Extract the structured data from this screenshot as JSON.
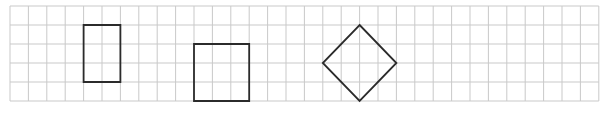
{
  "grid": {
    "columns": 32,
    "rows": 5,
    "line_color": "#c9c9c9",
    "shape_color": "#2b2b2b"
  },
  "shapes": [
    {
      "name": "rectangle",
      "kind": "polygon",
      "points_grid": [
        [
          4,
          1
        ],
        [
          6,
          1
        ],
        [
          6,
          4
        ],
        [
          4,
          4
        ]
      ],
      "width_cells": 2,
      "height_cells": 3
    },
    {
      "name": "square",
      "kind": "polygon",
      "points_grid": [
        [
          10,
          2
        ],
        [
          13,
          2
        ],
        [
          13,
          5
        ],
        [
          10,
          5
        ]
      ],
      "width_cells": 3,
      "height_cells": 3
    },
    {
      "name": "diamond",
      "kind": "polygon",
      "points_grid": [
        [
          19,
          1
        ],
        [
          21,
          3
        ],
        [
          19,
          5
        ],
        [
          17,
          3
        ]
      ],
      "width_cells": 4,
      "height_cells": 4
    }
  ]
}
